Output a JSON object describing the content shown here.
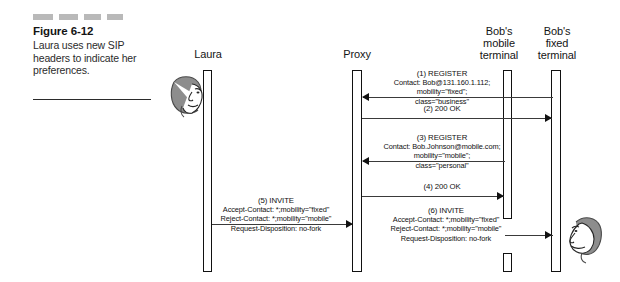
{
  "figure": {
    "redaction_bars": 4,
    "number": "Figure 6-12",
    "description": "Laura uses new SIP headers to indicate her preferences."
  },
  "actors": [
    {
      "id": "laura",
      "label": "Laura",
      "label_lines": [
        "Laura"
      ]
    },
    {
      "id": "proxy",
      "label": "Proxy",
      "label_lines": [
        "Proxy"
      ]
    },
    {
      "id": "mobile",
      "label": "Bob's mobile terminal",
      "label_lines": [
        "Bob's",
        "mobile",
        "terminal"
      ]
    },
    {
      "id": "fixed",
      "label": "Bob's fixed terminal",
      "label_lines": [
        "Bob's",
        "fixed",
        "terminal"
      ]
    }
  ],
  "messages": [
    {
      "seq": "(1)",
      "title": "(1) REGISTER",
      "lines": [
        "Contact: Bob@131.160.1.112;",
        "mobility=\"fixed\";",
        "class=\"business\""
      ],
      "from": "fixed",
      "to": "proxy",
      "direction": "left"
    },
    {
      "seq": "(2)",
      "title": "(2) 200 OK",
      "lines": [],
      "from": "proxy",
      "to": "fixed",
      "direction": "right"
    },
    {
      "seq": "(3)",
      "title": "(3) REGISTER",
      "lines": [
        "Contact: Bob.Johnson@mobile.com;",
        "mobility=\"mobile\";",
        "class=\"personal\""
      ],
      "from": "mobile",
      "to": "proxy",
      "direction": "left"
    },
    {
      "seq": "(4)",
      "title": "(4) 200 OK",
      "lines": [],
      "from": "proxy",
      "to": "mobile",
      "direction": "right"
    },
    {
      "seq": "(5)",
      "title": "(5) INVITE",
      "lines": [
        "Accept-Contact: *;mobility=\"fixed\"",
        "Reject-Contact: *;mobility=\"mobile\"",
        "Request-Disposition: no-fork"
      ],
      "from": "laura",
      "to": "proxy",
      "direction": "right"
    },
    {
      "seq": "(6)",
      "title": "(6) INVITE",
      "lines": [
        "Accept-Contact: *;mobility=\"fixed\"",
        "Reject-Contact: *;mobility=\"mobile\"",
        "Request-Disposition: no-fork"
      ],
      "from": "proxy",
      "to": "fixed",
      "direction": "right"
    }
  ],
  "people": [
    {
      "id": "laura-avatar",
      "name": "Laura"
    },
    {
      "id": "bob-avatar",
      "name": "Bob"
    }
  ],
  "colors": {
    "ink": "#111111",
    "line": "#3a3a3a",
    "redaction": "#b9b9b9",
    "caption_text": "#2b2b2b"
  }
}
